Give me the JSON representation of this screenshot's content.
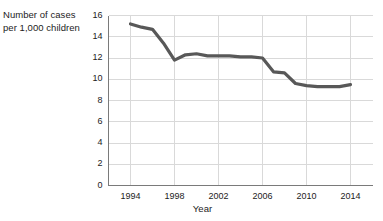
{
  "chart_data": {
    "type": "line",
    "title": "",
    "ylabel": "Number of cases per 1,000 children",
    "xlabel": "Year",
    "x": [
      1994,
      1995,
      1996,
      1997,
      1998,
      1999,
      2000,
      2001,
      2002,
      2003,
      2004,
      2005,
      2006,
      2007,
      2008,
      2009,
      2010,
      2011,
      2012,
      2013,
      2014
    ],
    "values": [
      15.2,
      14.9,
      14.7,
      13.4,
      11.8,
      12.3,
      12.4,
      12.2,
      12.2,
      12.2,
      12.1,
      12.1,
      12.0,
      10.7,
      10.6,
      9.6,
      9.4,
      9.3,
      9.3,
      9.3,
      9.5
    ],
    "series": [
      {
        "name": "Number of cases per 1,000 children",
        "values": [
          15.2,
          14.9,
          14.7,
          13.4,
          11.8,
          12.3,
          12.4,
          12.2,
          12.2,
          12.2,
          12.1,
          12.1,
          12.0,
          10.7,
          10.6,
          9.6,
          9.4,
          9.3,
          9.3,
          9.3,
          9.5
        ]
      }
    ],
    "xlim": [
      1992,
      2016
    ],
    "ylim": [
      0,
      16
    ],
    "ytick_labels": [
      "0",
      "2",
      "4",
      "6",
      "8",
      "10",
      "12",
      "14",
      "16"
    ],
    "ytick_values": [
      0,
      2,
      4,
      6,
      8,
      10,
      12,
      14,
      16
    ],
    "xtick_labels": [
      "1994",
      "1998",
      "2002",
      "2006",
      "2010",
      "2014"
    ],
    "xtick_values": [
      1994,
      1998,
      2002,
      2006,
      2010,
      2014
    ],
    "grid": true,
    "legend": "none",
    "line_color": "#585858",
    "grid_color": "#d9d9d9",
    "axis_color": "#7a7a7a"
  },
  "axis_titles": {
    "y_line1": "Number of cases",
    "y_line2": "per 1,000 children",
    "x": "Year"
  }
}
